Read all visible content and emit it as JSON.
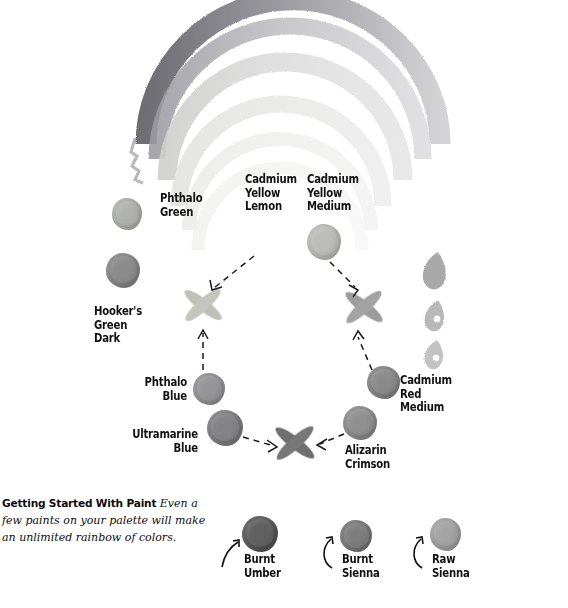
{
  "figure": {
    "title": "Getting Started With Paint",
    "caption_lead": "Getting Started With Paint",
    "caption_body": " Even a few paints on your palette will make an unlimited rainbow of colors."
  },
  "rainbow": {
    "name": "watercolor-rainbow-arc",
    "band_count": 6,
    "bands": [
      {
        "name": "band-violet",
        "color": "#6e6e72",
        "opacity": 0.85
      },
      {
        "name": "band-blue",
        "color": "#8c8c90",
        "opacity": 0.8
      },
      {
        "name": "band-green",
        "color": "#b4b4b6",
        "opacity": 0.75
      },
      {
        "name": "band-yellow",
        "color": "#d8d8d8",
        "opacity": 0.7
      },
      {
        "name": "band-orange",
        "color": "#e4e4e4",
        "opacity": 0.7
      },
      {
        "name": "band-red",
        "color": "#ededed",
        "opacity": 0.7
      }
    ]
  },
  "drips": [
    {
      "name": "drip-large",
      "color": "#9a9a9a"
    },
    {
      "name": "drip-medium",
      "color": "#b0b0b0"
    },
    {
      "name": "drip-small",
      "color": "#bdbdbd"
    }
  ],
  "wheel": {
    "name": "color-mixing-wheel",
    "pigments": [
      {
        "id": "phthalo-green",
        "label": "Phthalo\nGreen",
        "color": "#a8aaa5"
      },
      {
        "id": "hookers-green-dark",
        "label": "Hooker's\nGreen\nDark",
        "color": "#7e7e7e"
      },
      {
        "id": "cadmium-yellow-lemon",
        "label": "Cadmium\nYellow\nLemon",
        "color": "#c9c9c4"
      },
      {
        "id": "cadmium-yellow-medium",
        "label": "Cadmium\nYellow\nMedium",
        "color": "#b5b5b0"
      },
      {
        "id": "phthalo-blue",
        "label": "Phthalo\nBlue",
        "color": "#8a8a8c"
      },
      {
        "id": "ultramarine-blue",
        "label": "Ultramarine\nBlue",
        "color": "#757579"
      },
      {
        "id": "alizarin-crimson",
        "label": "Alizarin\nCrimson",
        "color": "#848484"
      },
      {
        "id": "cadmium-red-medium",
        "label": "Cadmium\nRed\nMedium",
        "color": "#7d7d7d"
      }
    ],
    "mixes": [
      {
        "id": "mix-green",
        "name": "mix-swatch-green",
        "color": "#bfc0b8"
      },
      {
        "id": "mix-orange",
        "name": "mix-swatch-orange",
        "color": "#9c9c9c"
      },
      {
        "id": "mix-violet",
        "name": "mix-swatch-violet",
        "color": "#6f6f6f"
      }
    ],
    "arrows": [
      {
        "name": "arrow-yellow-lemon-to-green",
        "from": "cadmium-yellow-lemon",
        "to": "mix-green"
      },
      {
        "name": "arrow-phthalo-blue-to-green",
        "from": "phthalo-blue",
        "to": "mix-green"
      },
      {
        "name": "arrow-yellow-medium-to-orange",
        "from": "cadmium-yellow-medium",
        "to": "mix-orange"
      },
      {
        "name": "arrow-cad-red-to-orange",
        "from": "cadmium-red-medium",
        "to": "mix-orange"
      },
      {
        "name": "arrow-ultramarine-to-violet",
        "from": "ultramarine-blue",
        "to": "mix-violet"
      },
      {
        "name": "arrow-alizarin-to-violet",
        "from": "alizarin-crimson",
        "to": "mix-violet"
      }
    ]
  },
  "earth_pigments": [
    {
      "id": "burnt-umber",
      "label": "Burnt\nUmber",
      "color": "#4e4e4e"
    },
    {
      "id": "burnt-sienna",
      "label": "Burnt\nSienna",
      "color": "#6f6f6f"
    },
    {
      "id": "raw-sienna",
      "label": "Raw\nSienna",
      "color": "#9a9a9a"
    }
  ],
  "colors": {
    "background": "#ffffff",
    "text": "#111111",
    "arrow": "#1a1a1a"
  }
}
